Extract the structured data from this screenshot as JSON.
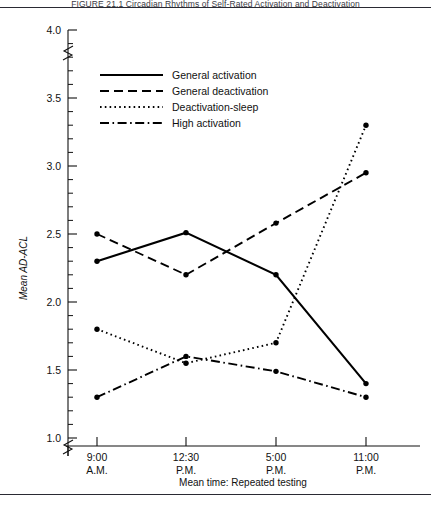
{
  "figure": {
    "caption_partial": "FIGURE 21.1    Circadian Rhythms of Self-Rated Activation and Deactivation",
    "frame_color": "#2a2a33"
  },
  "chart_data": {
    "type": "line",
    "title": "",
    "xlabel": "Mean time: Repeated testing",
    "ylabel": "Mean AD-ACL",
    "categories": [
      "9:00 A.M.",
      "12:30 P.M.",
      "5:00 P.M.",
      "11:00 P.M."
    ],
    "x_tick_lines": [
      {
        "top": "9:00",
        "bottom": "A.M."
      },
      {
        "top": "12:30",
        "bottom": "P.M."
      },
      {
        "top": "5:00",
        "bottom": "P.M."
      },
      {
        "top": "11:00",
        "bottom": "P.M."
      }
    ],
    "ylim": [
      1.0,
      4.0
    ],
    "y_major_ticks": [
      1.0,
      1.5,
      2.0,
      2.5,
      3.0,
      3.5,
      4.0
    ],
    "y_tick_labels": [
      "1.0",
      "1.5",
      "2.0",
      "2.5",
      "3.0",
      "3.5",
      "4.0"
    ],
    "y_minor_step": 0.1,
    "grid": false,
    "axis_break_top": true,
    "axis_break_bottom": true,
    "legend_position": "top-center",
    "series": [
      {
        "name": "General activation",
        "style": "solid",
        "dasharray": "",
        "values": [
          2.3,
          2.51,
          2.2,
          1.4
        ]
      },
      {
        "name": "General deactivation",
        "style": "dashed",
        "dasharray": "9,5",
        "values": [
          2.5,
          2.2,
          2.58,
          2.95
        ]
      },
      {
        "name": "Deactivation-sleep",
        "style": "dotted",
        "dasharray": "1.6,3.2",
        "values": [
          1.8,
          1.55,
          1.7,
          3.3
        ]
      },
      {
        "name": "High activation",
        "style": "dash-dot",
        "dasharray": "9,3.5,1.6,3.5",
        "values": [
          1.3,
          1.6,
          1.49,
          1.3
        ]
      }
    ]
  }
}
